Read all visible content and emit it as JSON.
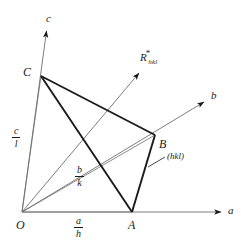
{
  "figure": {
    "type": "crystallographic-plane-diagram",
    "width": 241,
    "height": 251,
    "background_color": "#ffffff",
    "ink_color": "#1a1a1a"
  },
  "axes": [
    {
      "name": "a-axis",
      "label": "a",
      "from": [
        22,
        212
      ],
      "to": [
        225,
        212
      ]
    },
    {
      "name": "b-axis",
      "label": "b",
      "from": [
        22,
        212
      ],
      "to": [
        207,
        100
      ]
    },
    {
      "name": "c-axis",
      "label": "c",
      "from": [
        22,
        212
      ],
      "to": [
        47,
        28
      ]
    }
  ],
  "vertices": [
    {
      "name": "origin",
      "label": "O",
      "x": 22,
      "y": 212
    },
    {
      "name": "intercept-a",
      "label": "A",
      "x": 132,
      "y": 212
    },
    {
      "name": "intercept-b",
      "label": "B",
      "x": 155,
      "y": 135
    },
    {
      "name": "intercept-c",
      "label": "C",
      "x": 41,
      "y": 76
    }
  ],
  "intercepts": [
    {
      "name": "a-over-h",
      "numerator": "a",
      "denominator": "h"
    },
    {
      "name": "b-over-k",
      "numerator": "b",
      "denominator": "k"
    },
    {
      "name": "c-over-l",
      "numerator": "c",
      "denominator": "l"
    }
  ],
  "reciprocal_vector": {
    "name": "R-star-hkl",
    "symbol": "R",
    "superscript": "*",
    "subscript": "hkl",
    "from": [
      22,
      212
    ],
    "to": [
      141,
      71
    ]
  },
  "plane": {
    "name": "hkl-plane",
    "label": "(hkl)",
    "leader_from": [
      150,
      165
    ],
    "leader_to": [
      164,
      158
    ]
  },
  "edges": [
    {
      "name": "edge-C-B",
      "weight": "thick",
      "from": [
        41,
        76
      ],
      "to": [
        155,
        135
      ]
    },
    {
      "name": "edge-C-A",
      "weight": "thick",
      "from": [
        41,
        76
      ],
      "to": [
        132,
        212
      ]
    },
    {
      "name": "edge-B-A",
      "weight": "thick",
      "from": [
        155,
        135
      ],
      "to": [
        132,
        212
      ]
    },
    {
      "name": "edge-O-C",
      "weight": "thin",
      "from": [
        22,
        212
      ],
      "to": [
        41,
        76
      ]
    },
    {
      "name": "edge-O-B",
      "weight": "thin",
      "from": [
        22,
        212
      ],
      "to": [
        155,
        135
      ]
    },
    {
      "name": "edge-O-A",
      "weight": "thin",
      "from": [
        22,
        212
      ],
      "to": [
        132,
        212
      ]
    }
  ]
}
